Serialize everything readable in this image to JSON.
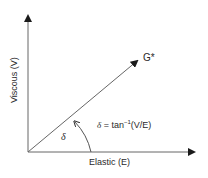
{
  "diagram": {
    "type": "phasor-vector",
    "axes": {
      "x_label": "Elastic (E)",
      "y_label": "Viscous (V)"
    },
    "vector": {
      "label": "G*"
    },
    "angle": {
      "symbol": "δ",
      "formula_lhs": "δ",
      "formula_rhs": "= tan",
      "formula_exp": "−1",
      "formula_arg": "(V/E)"
    },
    "colors": {
      "line": "#555555",
      "text": "#2a2a2a",
      "background": "#ffffff"
    }
  }
}
